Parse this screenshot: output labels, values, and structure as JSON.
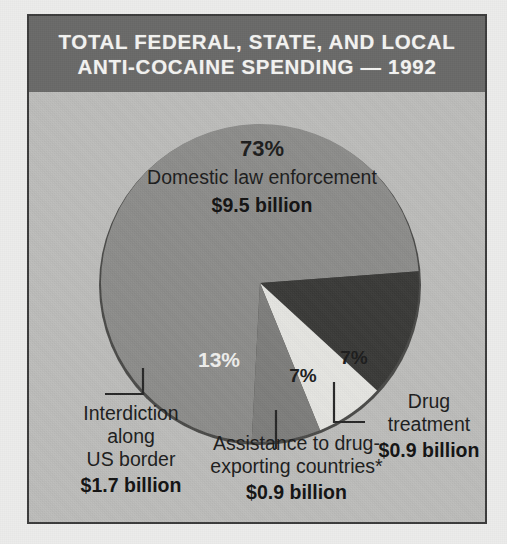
{
  "figure": {
    "title_line_1": "TOTAL FEDERAL, STATE, AND LOCAL",
    "title_line_2": "ANTI-COCAINE SPENDING — 1992",
    "title_bar_color": "#6a6a69",
    "panel_color": "#bdbdbb",
    "frame_color": "#3c3c3c"
  },
  "chart_data": {
    "type": "pie",
    "title": "TOTAL FEDERAL, STATE, AND LOCAL ANTI-COCAINE SPENDING — 1992",
    "unit": "billion USD",
    "total_value": 13.0,
    "categories": [
      "Domestic law enforcement",
      "Interdiction along US border",
      "Assistance to drug-exporting countries*",
      "Drug treatment"
    ],
    "values": [
      9.5,
      1.7,
      0.9,
      0.9
    ],
    "percents": [
      73,
      13,
      7,
      7
    ],
    "value_labels": [
      "$9.5 billion",
      "$1.7 billion",
      "$0.9 billion",
      "$0.9 billion"
    ],
    "percent_labels": [
      "73%",
      "13%",
      "7%",
      "7%"
    ],
    "colors": [
      "#8d8d8b",
      "#3a3a38",
      "#e6e6e2",
      "#7e7e7c"
    ],
    "label_positions": [
      "inside",
      "outside-left",
      "outside-bottom",
      "outside-right"
    ],
    "legend": "none",
    "grid": false,
    "footnote_marker": "*",
    "slices": [
      {
        "name": "Domestic law enforcement",
        "percent_label": "73%",
        "value_label": "$9.5 billion",
        "percent": 73,
        "value": 9.5,
        "color": "#8d8d8b",
        "label_color": "#1c1c1c"
      },
      {
        "name": "Interdiction along US border",
        "name_line_1": "Interdiction",
        "name_line_2": "along",
        "name_line_3": "US border",
        "percent_label": "13%",
        "value_label": "$1.7 billion",
        "percent": 13,
        "value": 1.7,
        "color": "#3a3a38",
        "label_color": "#f0f0ee"
      },
      {
        "name": "Assistance to drug-exporting countries*",
        "name_line_1": "Assistance to drug-",
        "name_line_2": "exporting countries*",
        "percent_label": "7%",
        "value_label": "$0.9 billion",
        "percent": 7,
        "value": 0.9,
        "color": "#e6e6e2",
        "label_color": "#1c1c1c"
      },
      {
        "name": "Drug treatment",
        "name_line_1": "Drug",
        "name_line_2": "treatment",
        "percent_label": "7%",
        "value_label": "$0.9 billion",
        "percent": 7,
        "value": 0.9,
        "color": "#7e7e7c",
        "label_color": "#1c1c1c"
      }
    ]
  }
}
